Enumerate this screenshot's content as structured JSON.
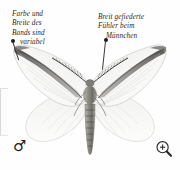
{
  "plate": {
    "subject": "moth-illustration",
    "species_sex": "male",
    "background_color": "#fefefe"
  },
  "callouts": [
    {
      "id": "left",
      "lines": [
        "Farbe und",
        "Breite des",
        "Bands sind",
        "variabel"
      ],
      "bullet_color": "#1b1a18",
      "points_to": "forewing-band"
    },
    {
      "id": "right",
      "lines": [
        "Breit gefiederte",
        "Fühler beim",
        "Männchen"
      ],
      "bullet_color": "#1b1a18",
      "points_to": "antenna"
    }
  ],
  "symbols": {
    "male_glyph": "♂",
    "male_label": "male-symbol",
    "zoom_icon": "magnifier-plus-icon"
  },
  "colors": {
    "text": "#2a2724",
    "leader": "#3a3734",
    "wing_fill": "#f4f4f2",
    "wing_band": "#7b7a76",
    "body": "#8d8b85"
  }
}
